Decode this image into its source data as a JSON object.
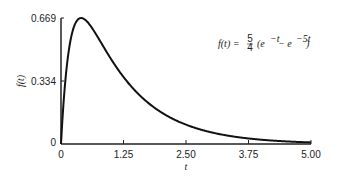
{
  "chart_data": {
    "type": "line",
    "title": "",
    "annotation": "f(t) = 5/4 (e^-t − e^-5t)",
    "xlabel": "t",
    "ylabel": "f(t)",
    "xlim": [
      0,
      5.0
    ],
    "ylim": [
      0,
      0.669
    ],
    "x_ticks": [
      "0",
      "1.25",
      "2.50",
      "3.75",
      "5.00"
    ],
    "y_ticks": [
      "0",
      "0.334",
      "0.669"
    ],
    "grid": false,
    "series": [
      {
        "name": "f(t)",
        "x": [
          0,
          0.1,
          0.2,
          0.3,
          0.402,
          0.5,
          0.75,
          1.0,
          1.25,
          1.5,
          2.0,
          2.5,
          3.0,
          3.5,
          4.0,
          4.5,
          5.0
        ],
        "values": [
          0,
          0.373,
          0.563,
          0.643,
          0.669,
          0.657,
          0.588,
          0.451,
          0.353,
          0.278,
          0.169,
          0.103,
          0.062,
          0.038,
          0.023,
          0.014,
          0.008
        ]
      }
    ]
  },
  "labels": {
    "y_top": "0.669",
    "y_mid": "0.334",
    "y_zero": "0",
    "x0": "0",
    "x1": "1.25",
    "x2": "2.50",
    "x3": "3.75",
    "x4": "5.00",
    "xlabel": "t",
    "ylabel": "f(t)",
    "formula_lhs": "f(t) =",
    "formula_num": "5",
    "formula_den": "4",
    "formula_rhs": "(e",
    "exp1": "−t",
    "minus": " − e",
    "exp2": "−5t",
    "close": ")"
  }
}
